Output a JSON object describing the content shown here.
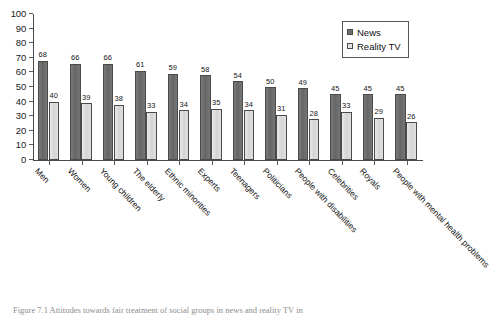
{
  "figure": {
    "caption": "Figure 7.1  Attitudes towards fair treatment of social groups in news and reality TV in"
  },
  "legend": {
    "position": "top-right",
    "items": [
      {
        "label": "News",
        "color": "#6e6e6e",
        "key": "news-legend"
      },
      {
        "label": "Reality TV",
        "color": "#e2e2e2",
        "key": "reality-tv-legend"
      }
    ]
  },
  "axes": {
    "y_ticks": [
      "0",
      "10",
      "20",
      "30",
      "40",
      "50",
      "60",
      "70",
      "80",
      "90",
      "100"
    ],
    "y_min": 0,
    "y_max": 100,
    "y_step": 10,
    "ylabel": "",
    "xlabel": ""
  },
  "chart_data": {
    "type": "bar",
    "title": "",
    "subtitle": "",
    "xlabel": "",
    "ylabel": "",
    "ylim": [
      0,
      100
    ],
    "ytick_step": 10,
    "grid": false,
    "legend_position": "top-right",
    "categories": [
      "Men",
      "Women",
      "Young children",
      "The elderly",
      "Ethnic minorities",
      "Experts",
      "Teenagers",
      "Politicians",
      "People with disabilities",
      "Celebrities",
      "Royals",
      "People with mental health problems"
    ],
    "series": [
      {
        "name": "News",
        "color": "#6e6e6e",
        "values": [
          68,
          66,
          66,
          61,
          59,
          58,
          54,
          50,
          49,
          45,
          45,
          45
        ]
      },
      {
        "name": "Reality TV",
        "color": "#e2e2e2",
        "values": [
          40,
          39,
          38,
          33,
          34,
          35,
          34,
          31,
          28,
          33,
          29,
          26
        ]
      }
    ]
  }
}
